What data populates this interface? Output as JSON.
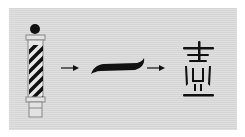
{
  "diagram": {
    "stages": [
      {
        "name": "barber-pole",
        "label": ""
      },
      {
        "name": "brush-stroke",
        "label": "一"
      },
      {
        "name": "chinese-character",
        "label": "壹"
      }
    ],
    "arrows": 2,
    "colors": {
      "background": "#dcdcdc",
      "ink": "#111111",
      "outline": "#888888"
    }
  }
}
